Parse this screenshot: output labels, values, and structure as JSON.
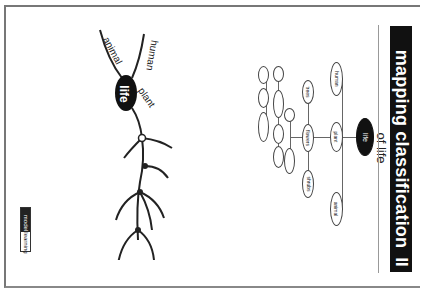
{
  "title": {
    "main": "mapping classification",
    "number": "II",
    "subtitle": "of life"
  },
  "illustration": {
    "center_label": "life",
    "branches": [
      "animal",
      "human",
      "plant"
    ]
  },
  "concept_map": {
    "root": "life",
    "level1": [
      "human",
      "plant",
      "animal"
    ],
    "level2": [
      "trees",
      "flowers",
      "shrubs"
    ]
  },
  "logo": {
    "part1": "model",
    "part2": "learning"
  }
}
